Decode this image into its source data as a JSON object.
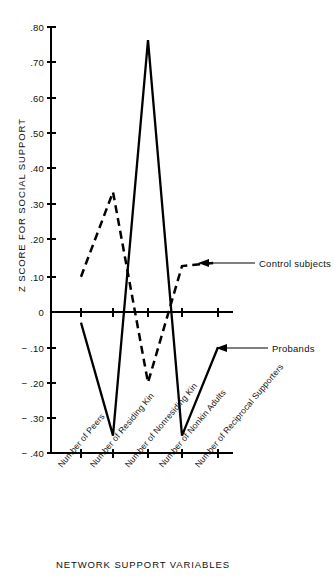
{
  "chart_data": {
    "type": "line",
    "title": "",
    "xlabel": "NETWORK SUPPORT VARIABLES",
    "ylabel": "Z SCORE FOR SOCIAL SUPPORT",
    "categories": [
      "Number of Peers",
      "Number of Residing Kin",
      "Number of Nonresiding Kin",
      "Number of Nonkin Adults",
      "Number of Reciprocal Supporters"
    ],
    "ylim": [
      -0.4,
      0.8
    ],
    "ytick_labels": [
      ".80",
      ".70",
      ".60",
      ".50",
      ".40",
      ".30",
      ".20",
      ".10",
      "0",
      "− .10",
      "− .20",
      "− .30",
      "− .40"
    ],
    "ytick_values": [
      0.8,
      0.7,
      0.6,
      0.5,
      0.4,
      0.3,
      0.2,
      0.1,
      0,
      -0.1,
      -0.2,
      -0.3,
      -0.4
    ],
    "grid": false,
    "legend_position": "inline-annotations",
    "series": [
      {
        "name": "Probands",
        "style": "solid",
        "color": "#000000",
        "values": [
          -0.03,
          -0.35,
          0.77,
          -0.35,
          -0.1
        ]
      },
      {
        "name": "Control subjects",
        "style": "dashed",
        "color": "#000000",
        "values": [
          0.1,
          0.34,
          -0.2,
          0.13,
          0.14
        ]
      }
    ],
    "annotations": [
      {
        "text": "Control subjects",
        "points_to_series": "Control subjects"
      },
      {
        "text": "Probands",
        "points_to_series": "Probands"
      }
    ]
  }
}
